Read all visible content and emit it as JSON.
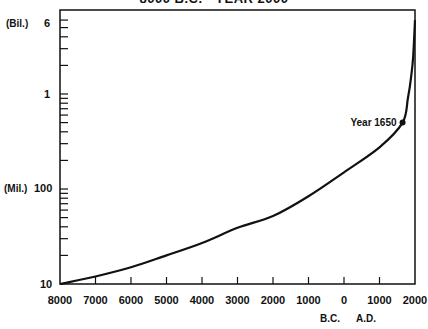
{
  "chart_data": {
    "type": "line",
    "title": "8000 B.C. - YEAR 2000",
    "xlabel": "B.C.   A.D.",
    "ylabel": "World population (log scale)",
    "x_tick_labels": [
      "8000",
      "7000",
      "6000",
      "5000",
      "4000",
      "3000",
      "2000",
      "1000",
      "0",
      "1000",
      "2000"
    ],
    "x_era_labels": {
      "bc": "B.C.",
      "ad": "A.D."
    },
    "y_scale": "log",
    "y_tick_labels": [
      {
        "label": "6",
        "unit": "(Bil.)",
        "value": 6000000000
      },
      {
        "label": "1",
        "unit": "",
        "value": 1000000000
      },
      {
        "label": "100",
        "unit": "(Mil.)",
        "value": 100000000
      },
      {
        "label": "10",
        "unit": "",
        "value": 10000000
      }
    ],
    "ylim": [
      10000000,
      6000000000
    ],
    "xlim": [
      -8000,
      2000
    ],
    "grid": false,
    "series": [
      {
        "name": "World population",
        "x": [
          -8000,
          -7000,
          -6000,
          -5000,
          -4000,
          -3000,
          -2000,
          -1000,
          0,
          1000,
          1650,
          1800,
          1900,
          1950,
          2000
        ],
        "values": [
          10000000,
          12000000,
          15000000,
          20000000,
          27000000,
          39000000,
          52000000,
          84000000,
          150000000,
          275000000,
          500000000,
          900000000,
          1600000000,
          2500000000,
          6000000000
        ]
      }
    ],
    "annotations": [
      {
        "text": "Year 1650",
        "x": 1650,
        "y": 500000000,
        "marker": "dot"
      }
    ]
  },
  "labels": {
    "title": "8000 B.C. - YEAR 2000",
    "bil": "(Bil.)",
    "mil": "(Mil.)",
    "y6": "6",
    "y1": "1",
    "y100": "100",
    "y10": "10",
    "annotation": "Year 1650",
    "bc": "B.C.",
    "ad": "A.D.",
    "x": [
      "8000",
      "7000",
      "6000",
      "5000",
      "4000",
      "3000",
      "2000",
      "1000",
      "0",
      "1000",
      "2000"
    ]
  }
}
